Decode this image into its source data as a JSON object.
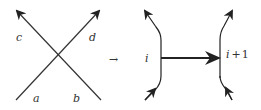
{
  "diagram": {
    "type": "crossing-to-arrow-transformation",
    "stroke_color": "#222222",
    "crossing": {
      "labels": {
        "top_left": "c",
        "top_right": "d",
        "bottom_left": "a",
        "bottom_right": "b"
      }
    },
    "transform_symbol": "→",
    "strands": {
      "left_label": "i",
      "right_label_var": "i",
      "right_label_op": "+",
      "right_label_num": "1"
    }
  }
}
